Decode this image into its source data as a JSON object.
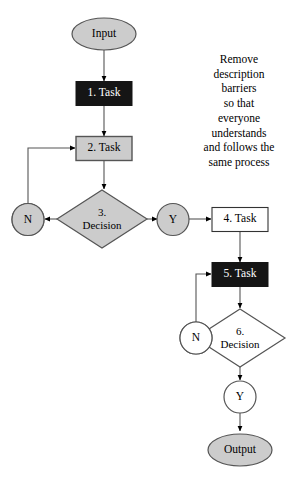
{
  "diagram": {
    "colors": {
      "fill_gray": "#cccccc",
      "fill_black": "#151515",
      "fill_white": "#ffffff",
      "stroke": "#555555",
      "stroke_dark": "#000000",
      "text_dark": "#000000",
      "text_light": "#ffffff",
      "background": "#ffffff"
    },
    "nodes": [
      {
        "id": "input",
        "label": "Input",
        "shape": "oval",
        "fill": "gray",
        "text": "dark"
      },
      {
        "id": "task1",
        "label": "1. Task",
        "shape": "rect",
        "fill": "black",
        "text": "light"
      },
      {
        "id": "task2",
        "label": "2. Task",
        "shape": "rect",
        "fill": "gray",
        "text": "dark"
      },
      {
        "id": "decision3",
        "label_line1": "3.",
        "label_line2": "Decision",
        "shape": "diamond",
        "fill": "gray",
        "text": "dark"
      },
      {
        "id": "n3",
        "label": "N",
        "shape": "circle",
        "fill": "gray",
        "text": "dark"
      },
      {
        "id": "y3",
        "label": "Y",
        "shape": "circle",
        "fill": "gray",
        "text": "dark"
      },
      {
        "id": "task4",
        "label": "4. Task",
        "shape": "rect",
        "fill": "white",
        "text": "dark"
      },
      {
        "id": "task5",
        "label": "5. Task",
        "shape": "rect",
        "fill": "black",
        "text": "light"
      },
      {
        "id": "decision6",
        "label_line1": "6.",
        "label_line2": "Decision",
        "shape": "diamond",
        "fill": "white",
        "text": "dark"
      },
      {
        "id": "n6",
        "label": "N",
        "shape": "circle",
        "fill": "white",
        "text": "dark"
      },
      {
        "id": "y6",
        "label": "Y",
        "shape": "circle",
        "fill": "white",
        "text": "dark"
      },
      {
        "id": "output",
        "label": "Output",
        "shape": "oval",
        "fill": "gray",
        "text": "dark"
      }
    ],
    "annotation": {
      "lines": [
        "Remove",
        "description",
        "barriers",
        "so that",
        "everyone",
        "understands",
        "and follows the",
        "same process"
      ]
    }
  }
}
